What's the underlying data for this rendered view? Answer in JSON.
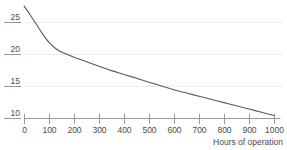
{
  "chart_data": {
    "type": "line",
    "title": "",
    "subtitle": "",
    "xlabel": "Hours of operation",
    "ylabel": "",
    "xlim": [
      0,
      1000
    ],
    "ylim": [
      8.8,
      27.6
    ],
    "grid": true,
    "legend": null,
    "x_ticks": [
      0,
      100,
      200,
      300,
      400,
      500,
      600,
      700,
      800,
      900,
      1000
    ],
    "x_tick_labels": [
      "0",
      "100",
      "200",
      "300",
      "400",
      "500",
      "600",
      "700",
      "800",
      "900",
      "1000"
    ],
    "y_ticks": [
      10,
      15,
      20,
      25
    ],
    "y_tick_labels": [
      "10",
      "15",
      "20",
      "25"
    ],
    "series": [
      {
        "name": "",
        "color": "#595959",
        "x": [
          0,
          25,
          50,
          75,
          100,
          125,
          150,
          200,
          250,
          300,
          350,
          400,
          450,
          500,
          550,
          600,
          650,
          700,
          750,
          800,
          850,
          900,
          950,
          1000
        ],
        "y": [
          27.5,
          26.1,
          24.6,
          23.1,
          21.8,
          20.9,
          20.3,
          19.5,
          18.8,
          18.1,
          17.4,
          16.8,
          16.2,
          15.6,
          15.0,
          14.4,
          13.9,
          13.4,
          12.9,
          12.4,
          11.9,
          11.4,
          10.9,
          10.4
        ]
      }
    ]
  },
  "axis": {
    "x_title": "Hours of operation"
  },
  "colors": {
    "line": "#595959",
    "grid": "#ececec",
    "axis": "#9a9a9a",
    "text": "#4a4a4a",
    "background": "#ffffff"
  }
}
